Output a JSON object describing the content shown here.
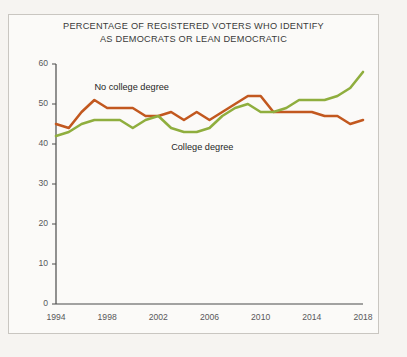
{
  "figure": {
    "title_line1": "PERCENTAGE OF REGISTERED VOTERS WHO IDENTIFY",
    "title_line2": "AS DEMOCRATS OR LEAN DEMOCRATIC",
    "background_color": "#f6f4f1",
    "panel_color": "#fbfaf8",
    "border_color": "#c9c6c1",
    "axis_color": "#4a4a4a"
  },
  "chart_data": {
    "type": "line",
    "title": "PERCENTAGE OF REGISTERED VOTERS WHO IDENTIFY AS DEMOCRATS OR LEAN DEMOCRATIC",
    "xlabel": "",
    "ylabel": "",
    "grid": false,
    "legend_position": "inline-annotation",
    "xlim": [
      1994,
      2018
    ],
    "ylim": [
      0,
      60
    ],
    "yticks": [
      0,
      10,
      20,
      30,
      40,
      50,
      60
    ],
    "xticks": [
      1994,
      1998,
      2002,
      2006,
      2010,
      2014,
      2018
    ],
    "x": [
      1994,
      1995,
      1996,
      1997,
      1998,
      1999,
      2000,
      2001,
      2002,
      2003,
      2004,
      2005,
      2006,
      2007,
      2008,
      2009,
      2010,
      2011,
      2012,
      2013,
      2014,
      2015,
      2016,
      2017,
      2018
    ],
    "series": [
      {
        "name": "No college degree",
        "color": "#c2581f",
        "values": [
          45,
          44,
          48,
          51,
          49,
          49,
          49,
          47,
          47,
          48,
          46,
          48,
          46,
          48,
          50,
          52,
          52,
          48,
          48,
          48,
          48,
          47,
          47,
          45,
          46
        ]
      },
      {
        "name": "College degree",
        "color": "#8fae3e",
        "values": [
          42,
          43,
          45,
          46,
          46,
          46,
          44,
          46,
          47,
          44,
          43,
          43,
          44,
          47,
          49,
          50,
          48,
          48,
          49,
          51,
          51,
          51,
          52,
          54,
          58
        ]
      }
    ],
    "annotations": [
      {
        "text": "No college degree",
        "x": 1997,
        "y": 54,
        "series": "No college degree"
      },
      {
        "text": "College degree",
        "x": 2003,
        "y": 39,
        "series": "College degree"
      }
    ]
  }
}
